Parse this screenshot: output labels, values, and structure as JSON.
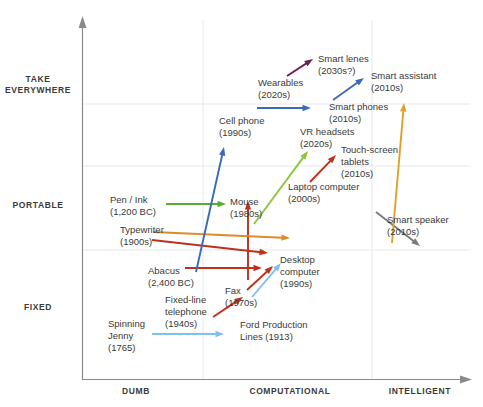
{
  "chart_data": {
    "type": "scatter",
    "title": "",
    "xlabel": "",
    "ylabel": "",
    "grid": true,
    "legend": "none",
    "x_axis": {
      "name": "capability",
      "ticks": [
        "DUMB",
        "COMPUTATIONAL",
        "INTELLIGENT"
      ],
      "tick_x": [
        136,
        290,
        420
      ],
      "arrow": true
    },
    "y_axis": {
      "name": "portability",
      "ticks": [
        "TAKE\nEVERYWHERE",
        "PORTABLE",
        "FIXED"
      ],
      "tick_y": [
        85,
        205,
        307
      ],
      "arrow": true
    },
    "gridlines": {
      "vertical_x": [
        203,
        372
      ],
      "horizontal_y": [
        104,
        166,
        250
      ]
    },
    "arrows": [
      {
        "name": "spinning-jenny-arrow",
        "color": "#7ec2ea",
        "x1": 152,
        "y1": 334,
        "x2": 224,
        "y2": 334
      },
      {
        "name": "ford-production-lines-arrow",
        "color": "#7ec2ea",
        "x1": 252,
        "y1": 297,
        "x2": 281,
        "y2": 263
      },
      {
        "name": "fixed-line-telephone-arrow",
        "color": "#c0301a",
        "x1": 213,
        "y1": 317,
        "x2": 243,
        "y2": 297
      },
      {
        "name": "fax-arrow",
        "color": "#c0301a",
        "x1": 247,
        "y1": 290,
        "x2": 273,
        "y2": 266
      },
      {
        "name": "abacus-arrow",
        "color": "#c0301a",
        "x1": 185,
        "y1": 268,
        "x2": 262,
        "y2": 268
      },
      {
        "name": "typewriter-arrow",
        "color": "#c0301a",
        "x1": 152,
        "y1": 240,
        "x2": 268,
        "y2": 253
      },
      {
        "name": "pen-ink-arrow",
        "color": "#5aab2e",
        "x1": 166,
        "y1": 204,
        "x2": 226,
        "y2": 204
      },
      {
        "name": "mouse-arrow",
        "color": "#c0301a",
        "x1": 248,
        "y1": 280,
        "x2": 248,
        "y2": 201
      },
      {
        "name": "laptop-computer-arrow",
        "color": "#e08a28",
        "x1": 153,
        "y1": 232,
        "x2": 290,
        "y2": 238
      },
      {
        "name": "vr-headsets-arrow",
        "color": "#8cc63f",
        "x1": 254,
        "y1": 224,
        "x2": 308,
        "y2": 151
      },
      {
        "name": "touch-screen-tablets-arrow",
        "color": "#c0301a",
        "x1": 310,
        "y1": 182,
        "x2": 336,
        "y2": 155
      },
      {
        "name": "cell-phone-arrow",
        "color": "#3a6bb5",
        "x1": 196,
        "y1": 272,
        "x2": 224,
        "y2": 147
      },
      {
        "name": "smart-phones-arrow",
        "color": "#3a6bb5",
        "x1": 257,
        "y1": 108,
        "x2": 311,
        "y2": 108
      },
      {
        "name": "wearables-arrow",
        "color": "#6b2352",
        "x1": 287,
        "y1": 76,
        "x2": 313,
        "y2": 59
      },
      {
        "name": "smart-assistant-arrow",
        "color": "#3a6bb5",
        "x1": 333,
        "y1": 100,
        "x2": 364,
        "y2": 78
      },
      {
        "name": "smart-speaker-arrow",
        "color": "#7a7a7a",
        "x1": 376,
        "y1": 212,
        "x2": 420,
        "y2": 246
      },
      {
        "name": "smart-speaker-up-arrow",
        "color": "#e0a028",
        "x1": 392,
        "y1": 243,
        "x2": 404,
        "y2": 103
      }
    ],
    "annotations": [
      {
        "name": "wearables",
        "text": "Wearables\n(2020s)",
        "x": 258,
        "y": 77,
        "align": "left"
      },
      {
        "name": "smart-lenes",
        "text": "Smart lenes\n(2030s?)",
        "x": 318,
        "y": 53,
        "align": "left"
      },
      {
        "name": "smart-assistant",
        "text": "Smart assistant\n(2010s)",
        "x": 371,
        "y": 70,
        "align": "left"
      },
      {
        "name": "smart-phones",
        "text": "Smart phones\n(2010s)",
        "x": 329,
        "y": 101,
        "align": "left"
      },
      {
        "name": "cell-phone",
        "text": "Cell phone\n(1990s)",
        "x": 219,
        "y": 115,
        "align": "left"
      },
      {
        "name": "vr-headsets",
        "text": "VR headsets\n(2020s)",
        "x": 300,
        "y": 126,
        "align": "left"
      },
      {
        "name": "touch-screen-tablets",
        "text": "Touch-screen\ntablets\n(2010s)",
        "x": 341,
        "y": 144,
        "align": "left"
      },
      {
        "name": "laptop-computer",
        "text": "Laptop computer\n(2000s)",
        "x": 288,
        "y": 181,
        "align": "left"
      },
      {
        "name": "mouse",
        "text": "Mouse\n(1980s)",
        "x": 230,
        "y": 196,
        "align": "left"
      },
      {
        "name": "pen-ink",
        "text": "Pen / Ink\n(1,200 BC)",
        "x": 110,
        "y": 194,
        "align": "left"
      },
      {
        "name": "typewriter",
        "text": "Typewriter\n(1900s)",
        "x": 120,
        "y": 224,
        "align": "left"
      },
      {
        "name": "smart-speaker",
        "text": "Smart speaker\n(2010s)",
        "x": 387,
        "y": 214,
        "align": "left"
      },
      {
        "name": "desktop-computer",
        "text": "Desktop\ncomputer\n(1990s)",
        "x": 280,
        "y": 254,
        "align": "left"
      },
      {
        "name": "abacus",
        "text": "Abacus\n(2,400 BC)",
        "x": 148,
        "y": 265,
        "align": "left"
      },
      {
        "name": "fax",
        "text": "Fax\n(1970s)",
        "x": 225,
        "y": 285,
        "align": "left"
      },
      {
        "name": "fixed-line-telephone",
        "text": "Fixed-line\ntelephone\n(1940s)",
        "x": 165,
        "y": 294,
        "align": "left"
      },
      {
        "name": "ford-production-lines",
        "text": "Ford Production\nLines (1913)",
        "x": 240,
        "y": 319,
        "align": "left"
      },
      {
        "name": "spinning-jenny",
        "text": "Spinning\nJenny\n(1765)",
        "x": 108,
        "y": 318,
        "align": "left"
      }
    ]
  },
  "colors": {
    "axis": "#8a8a8a",
    "grid": "#e8e8ec",
    "text": "#3a3a3a",
    "axis_text": "#3b3b3b",
    "red": "#c0301a",
    "orange": "#e08a28",
    "green": "#5aab2e",
    "light_green": "#8cc63f",
    "blue": "#3a6bb5",
    "light_blue": "#7ec2ea",
    "purple": "#6b2352",
    "gray": "#7a7a7a",
    "amber": "#e0a028"
  }
}
